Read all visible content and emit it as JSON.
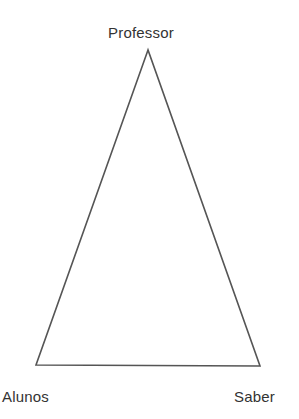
{
  "diagram": {
    "type": "didactic-triangle",
    "vertices": {
      "top": {
        "label": "Professor"
      },
      "bottom_left": {
        "label": "Alunos"
      },
      "bottom_right": {
        "label": "Saber"
      }
    },
    "colors": {
      "line": "#555555",
      "text": "#333333",
      "background": "#ffffff"
    }
  }
}
